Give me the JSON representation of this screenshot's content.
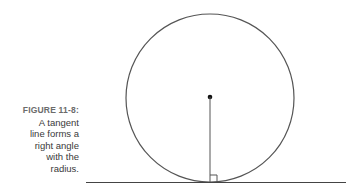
{
  "figure": {
    "label": "FIGURE 11-8:",
    "caption_lines": [
      "A tangent",
      "line forms a",
      "right angle",
      "with the",
      "radius."
    ]
  },
  "diagram": {
    "shapes": [
      "circle",
      "center-point",
      "radius-segment",
      "tangent-line",
      "right-angle-marker"
    ],
    "circle": {
      "cx": 210,
      "cy": 98,
      "r": 84
    },
    "tangent_line": {
      "x1": 86,
      "x2": 346,
      "y": 182
    },
    "stroke_color": "#555555"
  }
}
